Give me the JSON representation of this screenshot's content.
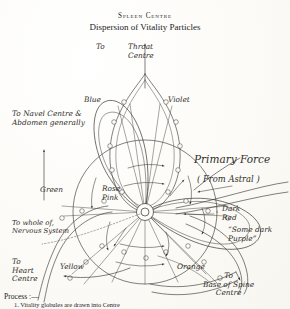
{
  "document": {
    "title_main": "Spleen Centre",
    "title_sub": "Dispersion of Vitality Particles"
  },
  "colors": {
    "ink": "#35332e",
    "paper": "#fdfdfb"
  },
  "diagram": {
    "type": "esoteric-chakra-diagram",
    "center_label": "Rose\nPink",
    "top_outflow": {
      "prefix": "To",
      "label": "Throat\nCentre"
    },
    "petal_labels": [
      {
        "name": "petal-label-blue",
        "text": "Blue"
      },
      {
        "name": "petal-label-violet",
        "text": "Violet"
      },
      {
        "name": "petal-label-green",
        "text": "Green"
      },
      {
        "name": "petal-label-yellow",
        "text": "Yellow"
      },
      {
        "name": "petal-label-orange",
        "text": "Orange"
      },
      {
        "name": "petal-label-dark-red",
        "text": "Dark\nRed"
      }
    ],
    "annotations": [
      {
        "name": "outflow-navel",
        "text": "To Navel Centre &\nAbdomen generally"
      },
      {
        "name": "outflow-nervous",
        "text": "To whole of,\nNervous System"
      },
      {
        "name": "outflow-heart",
        "text": "To\nHeart\nCentre"
      },
      {
        "name": "outflow-spine",
        "text": "To\nBase of Spine\nCentre"
      },
      {
        "name": "primary-force",
        "text": "Primary Force"
      },
      {
        "name": "from-astral",
        "text": "( From Astral )"
      },
      {
        "name": "some-dark-purple",
        "text": "“Some dark\nPurple”"
      }
    ],
    "footer": {
      "heading": "Process :—",
      "line_1": "1.  Vitality globules are drawn into Centre"
    }
  }
}
